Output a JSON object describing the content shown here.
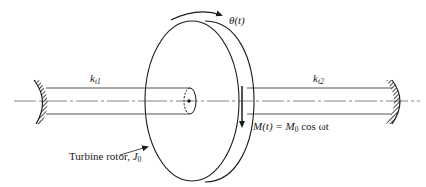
{
  "figure": {
    "colors": {
      "line": "#1a1a1a",
      "shaft": "#555555",
      "centerline": "#666666",
      "background": "#ffffff"
    },
    "labels": {
      "kt1_main": "k",
      "kt1_sub": "t1",
      "kt2_main": "k",
      "kt2_sub": "t2",
      "theta": "θ(t)",
      "moment_lhs": "M(t) = M",
      "moment_sub": "0",
      "moment_rhs": " cos ωt",
      "rotor_text": "Turbine rotor, ",
      "rotor_J": "J",
      "rotor_J_sub": "0"
    },
    "elements": {
      "left_support": "fixed-wall-hatched",
      "right_support": "fixed-wall-hatched",
      "left_shaft": "torsional spring k_t1",
      "right_shaft": "torsional spring k_t2",
      "disk": "turbine rotor J_0",
      "rotation_arrow": "theta(t) clockwise arrow",
      "torque_arrow": "M(t) downward arrow on rim"
    }
  }
}
